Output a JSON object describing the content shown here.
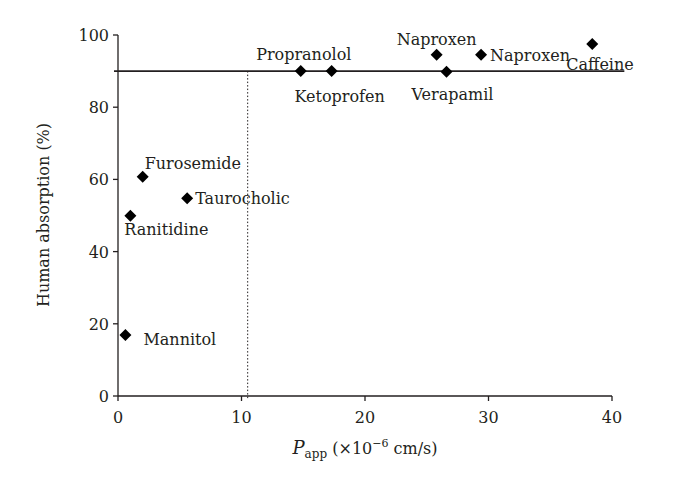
{
  "chart_data": {
    "type": "scatter",
    "title": "",
    "xlabel": "P_app (×10⁻⁶ cm/s)",
    "xlabel_main": "P",
    "xlabel_sub": "app",
    "xlabel_rest": " (×10",
    "xlabel_sup": "−6",
    "xlabel_unit": " cm/s)",
    "ylabel": "Human absorption (%)",
    "xlim": [
      0,
      40
    ],
    "ylim": [
      0,
      100
    ],
    "xticks": [
      0,
      10,
      20,
      30,
      40
    ],
    "yticks": [
      0,
      20,
      40,
      60,
      80,
      100
    ],
    "grid": false,
    "legend": null,
    "reference_lines": {
      "horizontal": {
        "y": 90,
        "style": "solid",
        "x_end": 41
      },
      "vertical": {
        "x": 10.5,
        "style": "dotted"
      }
    },
    "points": [
      {
        "name": "Propranolol",
        "x": 14.8,
        "y": 90.0,
        "label_pos": "above"
      },
      {
        "name": "Ketoprofen",
        "x": 17.3,
        "y": 90.0,
        "label_pos": "below"
      },
      {
        "name": "Naproxen",
        "x": 25.8,
        "y": 94.5,
        "label_pos": "above"
      },
      {
        "name": "Naproxen",
        "x": 29.4,
        "y": 94.5,
        "label_pos": "right"
      },
      {
        "name": "Verapamil",
        "x": 26.6,
        "y": 89.8,
        "label_pos": "below"
      },
      {
        "name": "Caffeine",
        "x": 38.4,
        "y": 97.5,
        "label_pos": "below"
      },
      {
        "name": "Furosemide",
        "x": 2.0,
        "y": 60.7,
        "label_pos": "above-right"
      },
      {
        "name": "Taurocholic",
        "x": 5.6,
        "y": 54.8,
        "label_pos": "right"
      },
      {
        "name": "Ranitidine",
        "x": 1.0,
        "y": 49.9,
        "label_pos": "below-right"
      },
      {
        "name": "Mannitol",
        "x": 0.6,
        "y": 16.9,
        "label_pos": "right"
      }
    ],
    "marker": "diamond",
    "marker_color": "#000000"
  },
  "colors": {
    "axis": "#231f20",
    "text": "#231f20",
    "marker": "#000000",
    "background": "#ffffff"
  }
}
